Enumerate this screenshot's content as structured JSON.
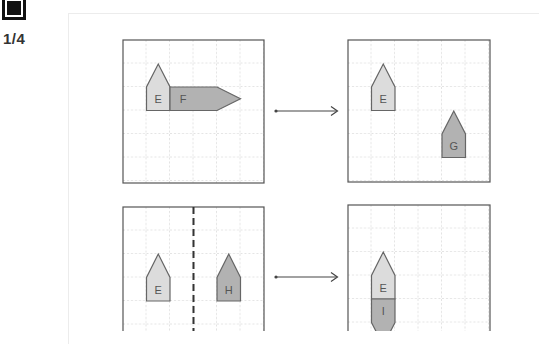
{
  "question": {
    "icon": "stop-square-icon",
    "number": "1/4"
  },
  "colors": {
    "light_shape": "#dcdcdc",
    "dark_shape": "#b2b2b2",
    "shape_border": "#666666",
    "grid_line": "#c8c8c8",
    "grid_border": "#555555"
  },
  "figures": [
    {
      "row": 1,
      "before": {
        "grid": "6x6",
        "shapes": [
          {
            "label": "E",
            "type": "house-up",
            "col": 1,
            "row": 2,
            "shade": "light"
          },
          {
            "label": "F",
            "type": "arrow-right",
            "col": 2,
            "row": 2,
            "shade": "dark"
          }
        ]
      },
      "after": {
        "grid": "6x6",
        "shapes": [
          {
            "label": "E",
            "type": "house-up",
            "col": 1,
            "row": 2,
            "shade": "light"
          },
          {
            "label": "G",
            "type": "house-up",
            "col": 4,
            "row": 4,
            "shade": "dark"
          }
        ]
      }
    },
    {
      "row": 2,
      "before": {
        "grid": "6x6",
        "mirror_line_col": 3,
        "shapes": [
          {
            "label": "E",
            "type": "house-up",
            "col": 1,
            "row": 3,
            "shade": "light"
          },
          {
            "label": "H",
            "type": "house-up",
            "col": 4,
            "row": 3,
            "shade": "dark"
          }
        ]
      },
      "after": {
        "grid": "6x6",
        "shapes": [
          {
            "label": "E",
            "type": "house-up",
            "col": 1,
            "row": 3,
            "shade": "light"
          },
          {
            "label": "I",
            "type": "house-down",
            "col": 1,
            "row": 4,
            "shade": "dark"
          }
        ]
      }
    }
  ],
  "labels": {
    "E1": "E",
    "F": "F",
    "E2": "E",
    "G": "G",
    "E3": "E",
    "H": "H",
    "E4": "E",
    "I": "I"
  }
}
